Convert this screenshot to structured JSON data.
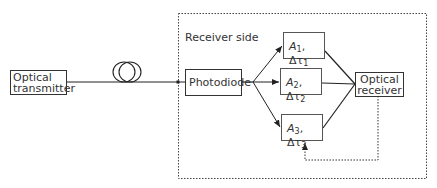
{
  "diagram": {
    "region_label": "Receiver side",
    "nodes": {
      "transmitter": {
        "line1": "Optical",
        "line2": "transmitter"
      },
      "fiber": {
        "icon": "fiber-coil-icon"
      },
      "photodiode": {
        "label": "Photodiode"
      },
      "branch1": {
        "amp": "A",
        "amp_sub": "1",
        "sep": ",",
        "delay": "Δτ",
        "delay_sub": "1"
      },
      "branch2": {
        "amp": "A",
        "amp_sub": "2",
        "sep": ",",
        "delay": "Δτ",
        "delay_sub": "2"
      },
      "branch3": {
        "amp": "A",
        "amp_sub": "3",
        "sep": ",",
        "delay": "Δτ",
        "delay_sub": "3"
      },
      "receiver": {
        "line1": "Optical",
        "line2": "receiver"
      }
    },
    "edges": [
      {
        "from": "transmitter",
        "to": "photodiode",
        "via": "fiber",
        "style": "solid"
      },
      {
        "from": "photodiode",
        "to": "branch1",
        "style": "solid-arrow"
      },
      {
        "from": "photodiode",
        "to": "branch2",
        "style": "solid-arrow"
      },
      {
        "from": "photodiode",
        "to": "branch3",
        "style": "solid-arrow"
      },
      {
        "from": "branch1",
        "to": "receiver",
        "style": "solid"
      },
      {
        "from": "branch2",
        "to": "receiver",
        "style": "solid"
      },
      {
        "from": "branch3",
        "to": "receiver",
        "style": "solid"
      },
      {
        "from": "receiver",
        "to": "branch3",
        "style": "dotted-arrow",
        "label": "feedback"
      }
    ],
    "colors": {
      "line": "#333333",
      "background": "#ffffff"
    }
  }
}
